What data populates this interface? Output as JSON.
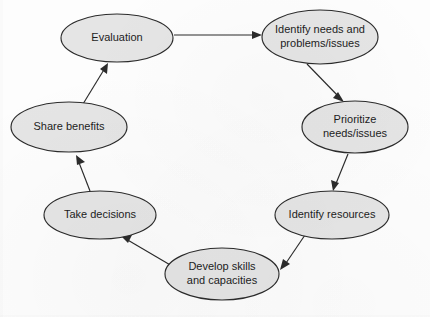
{
  "diagram": {
    "type": "cycle-flowchart",
    "background_color": "#fdfdfd",
    "node_fill_color": "#e5e5e5",
    "node_stroke_color": "#2b2b2b",
    "label_color": "#1d1d1d",
    "nodes": [
      {
        "id": "evaluation",
        "label": "Evaluation",
        "lines": [
          "Evaluation"
        ],
        "cx": 117,
        "cy": 38,
        "rx": 56,
        "ry": 24
      },
      {
        "id": "identify-needs",
        "label": "Identify needs and problems/issues",
        "lines": [
          "Identify needs and",
          "problems/issues"
        ],
        "cx": 320,
        "cy": 37,
        "rx": 58,
        "ry": 27
      },
      {
        "id": "prioritize-needs",
        "label": "Prioritize needs/issues",
        "lines": [
          "Prioritize",
          "needs/issues"
        ],
        "cx": 355,
        "cy": 127,
        "rx": 53,
        "ry": 26
      },
      {
        "id": "identify-resources",
        "label": "Identify resources",
        "lines": [
          "Identify resources"
        ],
        "cx": 332,
        "cy": 215,
        "rx": 57,
        "ry": 24
      },
      {
        "id": "develop-skills",
        "label": "Develop skills and capacities",
        "lines": [
          "Develop skills",
          "and capacities"
        ],
        "cx": 222,
        "cy": 274,
        "rx": 57,
        "ry": 26
      },
      {
        "id": "take-decisions",
        "label": "Take decisions",
        "lines": [
          "Take decisions"
        ],
        "cx": 100,
        "cy": 215,
        "rx": 56,
        "ry": 24
      },
      {
        "id": "share-benefits",
        "label": "Share benefits",
        "lines": [
          "Share benefits"
        ],
        "cx": 69,
        "cy": 127,
        "rx": 58,
        "ry": 25
      }
    ],
    "edges": [
      {
        "id": "edge-evaluation-to-identify-needs",
        "from": "evaluation",
        "to": "identify-needs",
        "from_label": "Evaluation",
        "to_label": "Identify needs and problems/issues"
      },
      {
        "id": "edge-identify-needs-to-prioritize",
        "from": "identify-needs",
        "to": "prioritize-needs",
        "from_label": "Identify needs and problems/issues",
        "to_label": "Prioritize needs/issues"
      },
      {
        "id": "edge-prioritize-to-identify-resources",
        "from": "prioritize-needs",
        "to": "identify-resources",
        "from_label": "Prioritize needs/issues",
        "to_label": "Identify resources"
      },
      {
        "id": "edge-identify-resources-to-develop-skills",
        "from": "identify-resources",
        "to": "develop-skills",
        "from_label": "Identify resources",
        "to_label": "Develop skills and capacities"
      },
      {
        "id": "edge-develop-skills-to-take-decisions",
        "from": "develop-skills",
        "to": "take-decisions",
        "from_label": "Develop skills and capacities",
        "to_label": "Take decisions"
      },
      {
        "id": "edge-take-decisions-to-share-benefits",
        "from": "take-decisions",
        "to": "share-benefits",
        "from_label": "Take decisions",
        "to_label": "Share benefits"
      },
      {
        "id": "edge-share-benefits-to-evaluation",
        "from": "share-benefits",
        "to": "evaluation",
        "from_label": "Share benefits",
        "to_label": "Evaluation"
      }
    ]
  }
}
